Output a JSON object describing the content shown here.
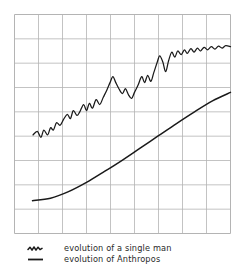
{
  "chart_data": {
    "type": "line",
    "title": "",
    "xlabel": "",
    "ylabel": "",
    "grid": true,
    "grid_columns": 9,
    "grid_rows": 9,
    "axis_tick_labels": [],
    "xlim": [
      0,
      9
    ],
    "ylim": [
      0,
      9
    ],
    "legend_position": "below-left",
    "colors": {
      "grid": "#b4b4b4",
      "curve": "#1a1a1a",
      "background": "#ffffff"
    },
    "series": [
      {
        "name": "evolution of a single man",
        "style": "jagged",
        "points": [
          [
            0.77,
            4.05
          ],
          [
            0.95,
            4.2
          ],
          [
            1.1,
            3.95
          ],
          [
            1.22,
            4.25
          ],
          [
            1.38,
            4.05
          ],
          [
            1.5,
            4.35
          ],
          [
            1.62,
            4.25
          ],
          [
            1.75,
            4.55
          ],
          [
            1.9,
            4.45
          ],
          [
            2.05,
            4.7
          ],
          [
            2.2,
            4.9
          ],
          [
            2.33,
            4.72
          ],
          [
            2.45,
            5.05
          ],
          [
            2.6,
            4.85
          ],
          [
            2.72,
            5.0
          ],
          [
            2.88,
            5.3
          ],
          [
            3.0,
            5.05
          ],
          [
            3.12,
            5.35
          ],
          [
            3.25,
            5.15
          ],
          [
            3.4,
            5.5
          ],
          [
            3.55,
            5.3
          ],
          [
            3.7,
            5.6
          ],
          [
            3.85,
            5.9
          ],
          [
            3.98,
            6.2
          ],
          [
            4.1,
            6.45
          ],
          [
            4.22,
            6.2
          ],
          [
            4.35,
            5.95
          ],
          [
            4.5,
            5.75
          ],
          [
            4.62,
            5.95
          ],
          [
            4.75,
            5.7
          ],
          [
            4.88,
            5.55
          ],
          [
            5.0,
            5.8
          ],
          [
            5.15,
            6.1
          ],
          [
            5.3,
            6.45
          ],
          [
            5.42,
            6.2
          ],
          [
            5.55,
            6.5
          ],
          [
            5.68,
            6.25
          ],
          [
            5.8,
            6.6
          ],
          [
            5.95,
            7.05
          ],
          [
            6.05,
            7.3
          ],
          [
            6.18,
            7.05
          ],
          [
            6.3,
            6.65
          ],
          [
            6.42,
            7.1
          ],
          [
            6.55,
            7.45
          ],
          [
            6.68,
            7.25
          ],
          [
            6.8,
            7.5
          ],
          [
            6.95,
            7.35
          ],
          [
            7.08,
            7.55
          ],
          [
            7.2,
            7.4
          ],
          [
            7.35,
            7.6
          ],
          [
            7.48,
            7.45
          ],
          [
            7.62,
            7.62
          ],
          [
            7.75,
            7.5
          ],
          [
            7.9,
            7.65
          ],
          [
            8.05,
            7.55
          ],
          [
            8.2,
            7.68
          ],
          [
            8.35,
            7.58
          ],
          [
            8.5,
            7.7
          ],
          [
            8.65,
            7.62
          ],
          [
            8.8,
            7.72
          ],
          [
            9.0,
            7.68
          ]
        ]
      },
      {
        "name": "evolution of Anthropos",
        "style": "smooth",
        "points": [
          [
            0.75,
            1.35
          ],
          [
            1.5,
            1.45
          ],
          [
            2.25,
            1.72
          ],
          [
            3.0,
            2.1
          ],
          [
            3.75,
            2.55
          ],
          [
            4.5,
            3.02
          ],
          [
            5.25,
            3.52
          ],
          [
            6.0,
            4.02
          ],
          [
            6.75,
            4.52
          ],
          [
            7.5,
            5.0
          ],
          [
            8.25,
            5.45
          ],
          [
            9.0,
            5.8
          ]
        ]
      }
    ]
  },
  "legend": {
    "items": [
      {
        "label": "evolution of a single man",
        "symbol": "wavy-line-symbol"
      },
      {
        "label": "evolution of Anthropos",
        "symbol": "straight-line-symbol"
      }
    ]
  }
}
